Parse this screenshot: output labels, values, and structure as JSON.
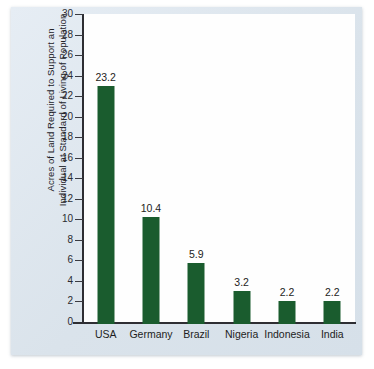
{
  "chart_data": {
    "type": "bar",
    "title": "",
    "subtitle": "",
    "xlabel": "",
    "ylabel_lines": [
      "Acres of Land Required to Support an",
      "Individual at Standard of Living of Population"
    ],
    "ylabel": "Acres of Land Required to Support an Individual at Standard of Living of Population",
    "categories": [
      "USA",
      "Germany",
      "Brazil",
      "Nigeria",
      "Indonesia",
      "India"
    ],
    "values": [
      23.2,
      10.4,
      5.9,
      3.2,
      2.2,
      2.2
    ],
    "value_labels": [
      "23.2",
      "10.4",
      "5.9",
      "3.2",
      "2.2",
      "2.2"
    ],
    "ylim": [
      0,
      30
    ],
    "ytick_step": 2,
    "yticks": [
      0,
      2,
      4,
      6,
      8,
      10,
      12,
      14,
      16,
      18,
      20,
      22,
      24,
      26,
      28,
      30
    ],
    "ytick_labels": [
      "0",
      "2",
      "4",
      "6",
      "8",
      "10",
      "12",
      "14",
      "16",
      "18",
      "20",
      "22",
      "24",
      "26",
      "28",
      "30"
    ],
    "grid": false,
    "legend": false,
    "legend_position": "none",
    "bar_color": "#1a5c2e",
    "plot_background": "#fefefe",
    "figure_background": "#dde6ee",
    "axis_color": "#2e2e33",
    "text_color": "#1d1d22"
  }
}
